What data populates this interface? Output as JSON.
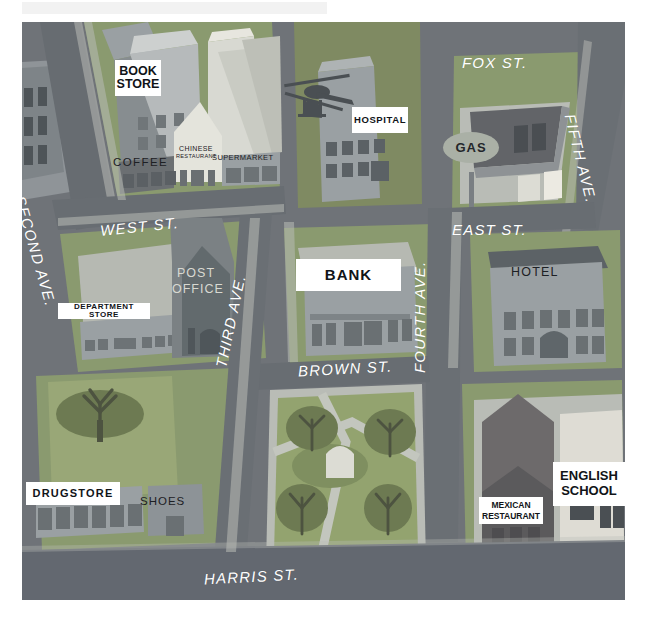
{
  "palette": {
    "road": "#6f7378",
    "road_dark": "#5d6166",
    "sidewalk": "#b9bcb6",
    "block_green": "#8a9a6f",
    "block_green_dark": "#79885f",
    "building_mid": "#9aa0a3",
    "building_light": "#d8d9d2",
    "building_dark": "#5a6166",
    "building_red": "#b0594a",
    "roof_light": "#e7e6df",
    "park_grass": "#93a36f",
    "tree": "#6d7a52",
    "white": "#ffffff",
    "ink": "#1d2024"
  },
  "streets": [
    {
      "name": "FOX ST.",
      "x": 462,
      "y": 41,
      "rot": 0,
      "size": 15
    },
    {
      "name": "WEST ST.",
      "x": 100,
      "y": 205,
      "rot": -6,
      "size": 15
    },
    {
      "name": "EAST ST.",
      "x": 452,
      "y": 208,
      "rot": 0,
      "size": 15
    },
    {
      "name": "BROWN ST.",
      "x": 297,
      "y": 348,
      "rot": -3,
      "size": 15
    },
    {
      "name": "HARRIS ST.",
      "x": 205,
      "y": 564,
      "rot": -3,
      "size": 15
    }
  ],
  "avenues": [
    {
      "name": "SECOND AVE.",
      "x": 30,
      "y": 170,
      "rot": 74,
      "size": 15
    },
    {
      "name": "THIRD AVE.",
      "x": 232,
      "y": 345,
      "rot": 78,
      "size": 15
    },
    {
      "name": "FOURTH AVE.",
      "x": 420,
      "y": 300,
      "rot": 90,
      "size": 15
    },
    {
      "name": "FIFTH AVE.",
      "x": 572,
      "y": 115,
      "rot": 76,
      "size": 15
    }
  ],
  "signs": [
    {
      "label": "BOOK\nSTORE",
      "x": 115,
      "y": 60,
      "w": 46,
      "h": 34,
      "size": 12.5,
      "style": "white"
    },
    {
      "label": "HOSPITAL",
      "x": 352,
      "y": 107,
      "w": 52,
      "h": 24,
      "size": 9.5,
      "style": "white"
    },
    {
      "label": "DEPARTMENT STORE",
      "x": 58,
      "y": 303,
      "w": 86,
      "h": 16,
      "size": 8,
      "style": "white"
    },
    {
      "label": "BANK",
      "x": 296,
      "y": 259,
      "w": 105,
      "h": 31,
      "size": 15,
      "style": "white"
    },
    {
      "label": "DRUGSTORE",
      "x": 26,
      "y": 482,
      "w": 92,
      "h": 22,
      "size": 11,
      "style": "white"
    },
    {
      "label": "MEXICAN\nRESTAURANT",
      "x": 479,
      "y": 497,
      "w": 62,
      "h": 26,
      "size": 8.5,
      "style": "white"
    },
    {
      "label": "ENGLISH\nSCHOOL",
      "x": 553,
      "y": 462,
      "w": 72,
      "h": 42,
      "size": 13,
      "style": "white"
    },
    {
      "label": "GAS",
      "x": 443,
      "y": 132,
      "w": 54,
      "h": 30,
      "size": 13,
      "style": "oval"
    }
  ],
  "building_labels": [
    {
      "label": "COFFEE",
      "x": 111,
      "y": 163,
      "size": 11.5,
      "tone": "dark"
    },
    {
      "label": "CHINESE",
      "x": 175,
      "y": 155,
      "size": 7,
      "tone": "dark"
    },
    {
      "label": "RESTAURANT",
      "x": 172,
      "y": 163,
      "size": 5.5,
      "tone": "dark"
    },
    {
      "label": "SUPERMARKET",
      "x": 210,
      "y": 163,
      "size": 7.5,
      "tone": "dark"
    },
    {
      "label": "POST",
      "x": 176,
      "y": 272,
      "size": 12,
      "tone": "dark"
    },
    {
      "label": "OFFICE",
      "x": 172,
      "y": 288,
      "size": 12,
      "tone": "dark"
    },
    {
      "label": "HOTEL",
      "x": 511,
      "y": 268,
      "size": 12,
      "tone": "dark"
    },
    {
      "label": "SHOES",
      "x": 140,
      "y": 500,
      "size": 11.5,
      "tone": "dark"
    }
  ],
  "features": {
    "helicopter": "helicopter-icon",
    "park_trees": 4,
    "left_park_trees": 1,
    "park_paths": true
  }
}
